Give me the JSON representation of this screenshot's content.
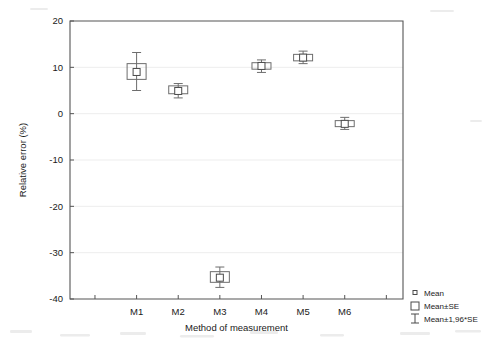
{
  "chart_data": {
    "type": "box",
    "title": "",
    "xlabel": "Method of measurement",
    "ylabel": "Relative error (%)",
    "categories": [
      "M1",
      "M2",
      "M3",
      "M4",
      "M5",
      "M6"
    ],
    "ylim": [
      -40,
      20
    ],
    "ytick_labels": [
      "20",
      "10",
      "0",
      "-10",
      "-20",
      "-30",
      "-40"
    ],
    "ytick_values": [
      20,
      10,
      0,
      -10,
      -20,
      -30,
      -40
    ],
    "grid": true,
    "legend_position": "bottom-right",
    "series": [
      {
        "name": "Mean",
        "values": [
          9.0,
          4.9,
          -35.4,
          10.3,
          12.1,
          -2.2
        ]
      },
      {
        "name": "Mean±SE",
        "lower": [
          7.4,
          4.3,
          -36.4,
          9.6,
          11.4,
          -2.8
        ],
        "upper": [
          10.8,
          6.0,
          -34.1,
          11.0,
          12.8,
          -1.5
        ]
      },
      {
        "name": "Mean±1,96*SE",
        "lower": [
          5.0,
          3.4,
          -37.5,
          8.9,
          10.8,
          -3.4
        ],
        "upper": [
          13.2,
          6.5,
          -33.1,
          11.6,
          13.5,
          -0.8
        ]
      }
    ],
    "points": [
      {
        "category": "M1",
        "mean": 9.0,
        "se_low": 7.4,
        "se_high": 10.8,
        "ci_low": 5.0,
        "ci_high": 13.2
      },
      {
        "category": "M2",
        "mean": 4.9,
        "se_low": 4.3,
        "se_high": 6.0,
        "ci_low": 3.4,
        "ci_high": 6.5
      },
      {
        "category": "M3",
        "mean": -35.4,
        "se_low": -36.4,
        "se_high": -34.1,
        "ci_low": -37.5,
        "ci_high": -33.1
      },
      {
        "category": "M4",
        "mean": 10.3,
        "se_low": 9.6,
        "se_high": 11.0,
        "ci_low": 8.9,
        "ci_high": 11.6
      },
      {
        "category": "M5",
        "mean": 12.1,
        "se_low": 11.4,
        "se_high": 12.8,
        "ci_low": 10.8,
        "ci_high": 13.5
      },
      {
        "category": "M6",
        "mean": -2.2,
        "se_low": -2.8,
        "se_high": -1.5,
        "ci_low": -3.4,
        "ci_high": -0.8
      }
    ]
  },
  "legend": {
    "items": [
      {
        "label": "Mean",
        "glyph": "small-square-marker"
      },
      {
        "label": "Mean±SE",
        "glyph": "large-square-marker"
      },
      {
        "label": "Mean±1,96*SE",
        "glyph": "i-beam-whisker-marker"
      }
    ]
  },
  "colors": {
    "axis": "#555555",
    "grid": "#e9e9e9",
    "marker": "#4a4a4a",
    "box": "#6d6d6d",
    "background": "#ffffff"
  }
}
